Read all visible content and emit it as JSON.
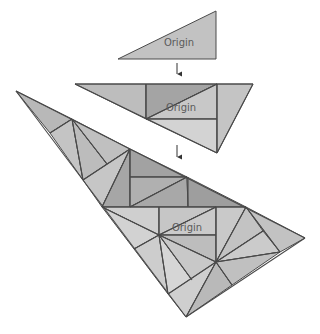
{
  "diagram": {
    "title": "",
    "colors": {
      "stroke": "#4a4a4a",
      "arrow": "#333333",
      "label": "#5a5a5a"
    },
    "figures": [
      {
        "id": "stage-1",
        "label": {
          "text": "Origin",
          "x": 179,
          "y": 46
        },
        "polygons": [
          {
            "points": "118,59 216,11 216,59",
            "fill": "#c2c2c2",
            "name": "origin-triangle"
          }
        ],
        "lines": []
      },
      {
        "id": "stage-2",
        "label": {
          "text": "Origin",
          "x": 181,
          "y": 111
        },
        "polygons": [
          {
            "points": "75,84 146,84 146,119",
            "fill": "#bdbdbd",
            "name": "left-region"
          },
          {
            "points": "146,84 217,84 146,119",
            "fill": "#a4a4a4",
            "name": "dark-triangle"
          },
          {
            "points": "146,119 217,84 217,119",
            "fill": "#c8c8c8",
            "name": "origin-triangle"
          },
          {
            "points": "146,119 217,119 217,153",
            "fill": "#d3d3d3",
            "name": "lower-triangle"
          },
          {
            "points": "217,84 253,84 217,153",
            "fill": "#c4c4c4",
            "name": "right-triangle"
          }
        ],
        "lines": [
          "75,84 253,84",
          "75,84 217,153",
          "253,84 217,153",
          "146,84 146,119",
          "217,84 217,153",
          "146,119 217,84",
          "146,119 217,119"
        ]
      },
      {
        "id": "stage-3",
        "label": {
          "text": "Origin",
          "x": 187,
          "y": 231
        },
        "polygons": [
          {
            "points": "16,91 72,119 50,133",
            "fill": "#b8b8b8",
            "name": "tip-region"
          },
          {
            "points": "50,133 72,119 83,180",
            "fill": "#c4c4c4",
            "name": "left-sliver-1"
          },
          {
            "points": "72,119 107,164 83,180",
            "fill": "#bcbcbc",
            "name": "left-sliver-2"
          },
          {
            "points": "72,119 130,149 107,164",
            "fill": "#c0c0c0",
            "name": "left-sliver-3"
          },
          {
            "points": "83,180 130,149 102,207",
            "fill": "#c6c6c6",
            "name": "left-sliver-4"
          },
          {
            "points": "130,149 130,207 102,207",
            "fill": "#a6a6a6",
            "name": "dark-wedge"
          },
          {
            "points": "130,149 187,177 130,177",
            "fill": "#a2a2a2",
            "name": "dark-top"
          },
          {
            "points": "130,177 187,177 130,207",
            "fill": "#b0b0b0",
            "name": "dark-mid"
          },
          {
            "points": "187,177 188,207 130,207",
            "fill": "#a8a8a8",
            "name": "dark-low"
          },
          {
            "points": "187,177 246,207 188,207",
            "fill": "#9e9e9e",
            "name": "dark-right"
          },
          {
            "points": "102,207 159,207 159,235",
            "fill": "#cfcfcf",
            "name": "origin-left-a"
          },
          {
            "points": "159,207 216,207 159,235",
            "fill": "#c6c6c6",
            "name": "origin-left-b"
          },
          {
            "points": "159,235 216,207 216,235",
            "fill": "#cacaca",
            "name": "origin-triangle"
          },
          {
            "points": "159,235 216,235 216,262",
            "fill": "#bdbdbd",
            "name": "origin-below"
          },
          {
            "points": "102,207 159,235 134,249",
            "fill": "#d2d2d2",
            "name": "fan-1"
          },
          {
            "points": "134,249 159,235 168,294",
            "fill": "#cdcdcd",
            "name": "fan-2"
          },
          {
            "points": "159,235 192,280 168,294",
            "fill": "#d6d6d6",
            "name": "fan-3"
          },
          {
            "points": "159,235 216,262 192,280",
            "fill": "#c8c8c8",
            "name": "fan-4"
          },
          {
            "points": "168,294 216,262 186,317",
            "fill": "#cfcfcf",
            "name": "fan-5"
          },
          {
            "points": "186,317 216,262 232,285",
            "fill": "#b9b9b9",
            "name": "fan-6"
          },
          {
            "points": "216,207 246,207 216,262",
            "fill": "#c9c9c9",
            "name": "right-a"
          },
          {
            "points": "246,207 263,231 216,262",
            "fill": "#c3c3c3",
            "name": "right-b"
          },
          {
            "points": "263,231 280,252 216,262",
            "fill": "#cbcbcb",
            "name": "right-c"
          },
          {
            "points": "216,262 280,252 232,285",
            "fill": "#c0c0c0",
            "name": "right-d"
          },
          {
            "points": "246,207 305,238 280,252",
            "fill": "#c2c2c2",
            "name": "right-tip"
          }
        ],
        "lines": [
          "16,91 305,238",
          "16,91 186,317",
          "186,317 305,238",
          "50,133 72,119",
          "72,119 83,180",
          "72,119 107,164",
          "83,180 130,149",
          "130,149 102,207",
          "130,149 130,207",
          "130,177 187,177",
          "188,177 188,207",
          "130,207 187,177",
          "102,207 246,207",
          "159,207 159,235",
          "102,207 159,235",
          "159,235 216,207",
          "159,235 216,235",
          "216,207 216,262",
          "159,235 216,262",
          "159,235 134,249",
          "159,235 168,294",
          "159,235 192,280",
          "168,294 216,262",
          "216,262 186,317",
          "216,262 232,285",
          "216,262 246,207",
          "216,262 263,231",
          "216,262 280,252",
          "246,207 280,252"
        ]
      }
    ],
    "arrows": [
      {
        "x": 177,
        "y1": 63,
        "y2": 79,
        "name": "arrow-down-1"
      },
      {
        "x": 177,
        "y1": 145,
        "y2": 162,
        "name": "arrow-down-2"
      }
    ]
  }
}
